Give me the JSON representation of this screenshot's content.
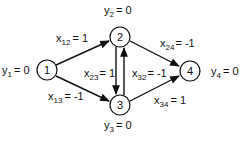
{
  "diagram": {
    "type": "directed-network-flow-graph",
    "nodes": [
      {
        "id": "1",
        "label": "1",
        "x": 47,
        "y": 70,
        "potential_label": {
          "var": "y",
          "sub": "1",
          "value": "= 0"
        }
      },
      {
        "id": "2",
        "label": "2",
        "x": 120,
        "y": 37,
        "potential_label": {
          "var": "y",
          "sub": "2",
          "value": "= 0"
        }
      },
      {
        "id": "3",
        "label": "3",
        "x": 120,
        "y": 105,
        "potential_label": {
          "var": "y",
          "sub": "3",
          "value": "= 0"
        }
      },
      {
        "id": "4",
        "label": "4",
        "x": 190,
        "y": 71,
        "potential_label": {
          "var": "y",
          "sub": "4",
          "value": "= 0"
        }
      }
    ],
    "edges": [
      {
        "from": "1",
        "to": "2",
        "label": {
          "var": "x",
          "sub": "12",
          "value": "= 1"
        }
      },
      {
        "from": "1",
        "to": "3",
        "label": {
          "var": "x",
          "sub": "13",
          "value": "= -1"
        }
      },
      {
        "from": "2",
        "to": "3",
        "label": {
          "var": "x",
          "sub": "23",
          "value": "= 1"
        }
      },
      {
        "from": "3",
        "to": "2",
        "label": {
          "var": "x",
          "sub": "32",
          "value": "= -1"
        }
      },
      {
        "from": "2",
        "to": "4",
        "label": {
          "var": "x",
          "sub": "24",
          "value": "= -1"
        }
      },
      {
        "from": "3",
        "to": "4",
        "label": {
          "var": "x",
          "sub": "34",
          "value": "= 1"
        }
      }
    ]
  },
  "labels": {
    "y1": {
      "var": "y",
      "sub": "1",
      "value": "= 0"
    },
    "y2": {
      "var": "y",
      "sub": "2",
      "value": "= 0"
    },
    "y3": {
      "var": "y",
      "sub": "3",
      "value": "= 0"
    },
    "y4": {
      "var": "y",
      "sub": "4",
      "value": "= 0"
    },
    "x12": {
      "var": "x",
      "sub": "12",
      "value": "= 1"
    },
    "x13": {
      "var": "x",
      "sub": "13",
      "value": "= -1"
    },
    "x23": {
      "var": "x",
      "sub": "23",
      "value": "= 1"
    },
    "x32": {
      "var": "x",
      "sub": "32",
      "value": "= -1"
    },
    "x24": {
      "var": "x",
      "sub": "24",
      "value": "= -1"
    },
    "x34": {
      "var": "x",
      "sub": "34",
      "value": "= 1"
    }
  },
  "node_labels": {
    "n1": "1",
    "n2": "2",
    "n3": "3",
    "n4": "4"
  }
}
